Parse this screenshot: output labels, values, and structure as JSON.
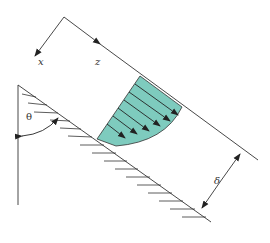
{
  "diagram": {
    "labels": {
      "x_axis": "x",
      "z_axis": "z",
      "angle": "θ",
      "thickness": "δ"
    },
    "colors": {
      "fluid_fill": "#7ecbbe",
      "line": "#333333",
      "arrow": "#222222"
    },
    "velocity_arrows": 6
  }
}
